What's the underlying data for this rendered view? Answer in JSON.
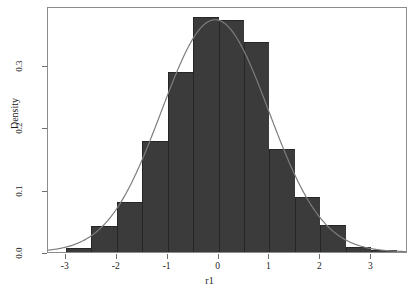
{
  "chart_data": {
    "type": "bar",
    "title": "",
    "subtitle": "",
    "xlabel": "r1",
    "ylabel": "Density",
    "xlim": [
      -3.35,
      3.72
    ],
    "ylim": [
      0.0,
      0.395
    ],
    "xticks": [
      -3,
      -2,
      -1,
      0,
      1,
      2,
      3
    ],
    "xtick_labels": [
      "-3",
      "-2",
      "-1",
      "0",
      "1",
      "2",
      "3"
    ],
    "yticks": [
      0.0,
      0.1,
      0.2,
      0.3
    ],
    "ytick_labels": [
      "0.0",
      "0.1",
      "0.2",
      "0.3"
    ],
    "grid": false,
    "legend": null,
    "annotations": [],
    "bin_width": 0.5,
    "bin_edges": [
      -3.0,
      -2.5,
      -2.0,
      -1.5,
      -1.0,
      -0.5,
      0.0,
      0.5,
      1.0,
      1.5,
      2.0,
      2.5,
      3.0,
      3.5
    ],
    "categories": [
      "-3.0 to -2.5",
      "-2.5 to -2.0",
      "-2.0 to -1.5",
      "-1.5 to -1.0",
      "-1.0 to -0.5",
      "-0.5 to 0.0",
      "0.0 to 0.5",
      "0.5 to 1.0",
      "1.0 to 1.5",
      "1.5 to 2.0",
      "2.0 to 2.5",
      "2.5 to 3.0",
      "3.0 to 3.5"
    ],
    "values": [
      0.006,
      0.042,
      0.081,
      0.178,
      0.289,
      0.377,
      0.372,
      0.338,
      0.165,
      0.089,
      0.043,
      0.008,
      0.003
    ],
    "series": [
      {
        "name": "Histogram (Density)",
        "type": "bar",
        "color": "#3b3b3b",
        "edge_color": "#262626",
        "values": [
          0.006,
          0.042,
          0.081,
          0.178,
          0.289,
          0.377,
          0.372,
          0.338,
          0.165,
          0.089,
          0.043,
          0.008,
          0.003
        ]
      },
      {
        "name": "Normal density curve",
        "type": "line",
        "color": "#7d7d7d",
        "mean": -0.05,
        "sd": 1.06,
        "peak": 0.376
      }
    ]
  },
  "axes": {
    "x_title": "r1",
    "y_title": "Density"
  },
  "colors": {
    "bar_fill": "#3b3b3b",
    "bar_edge": "#262626",
    "curve": "#7d7d7d",
    "frame": "#8c8c8c",
    "text": "#1a1a1a",
    "background": "#ffffff"
  }
}
